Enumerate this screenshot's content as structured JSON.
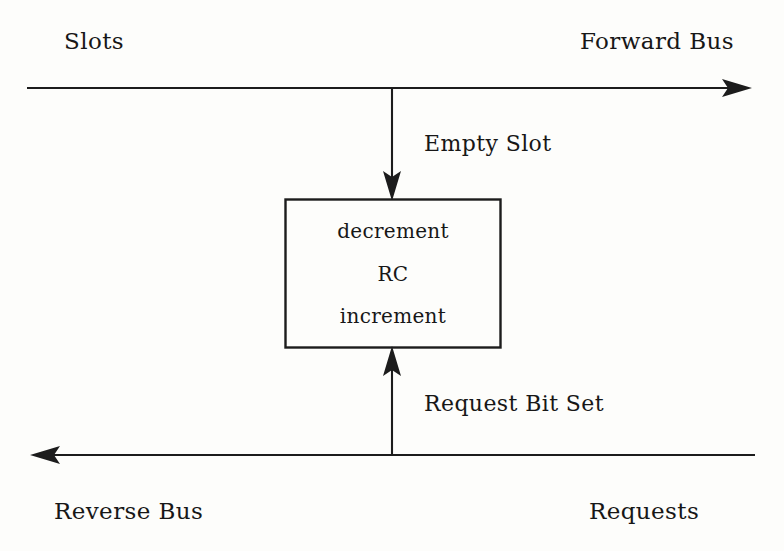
{
  "figure": {
    "kind": "block-diagram",
    "background_color": "#fdfdfb",
    "ink_color": "#1c1c1c"
  },
  "labels": {
    "slots": "Slots",
    "forward_bus": "Forward Bus",
    "empty_slot": "Empty Slot",
    "request_bit_set": "Request Bit Set",
    "reverse_bus": "Reverse Bus",
    "requests": "Requests"
  },
  "node": {
    "name": "RC",
    "lines": [
      "decrement",
      "RC",
      "increment"
    ]
  },
  "connections": [
    {
      "id": "forward-bus",
      "from": "Slots",
      "to": "Forward Bus",
      "direction": "right",
      "arrow": "end"
    },
    {
      "id": "empty-slot-tap",
      "from": "Forward Bus",
      "to": "RC",
      "direction": "down",
      "arrow": "end",
      "label": "Empty Slot"
    },
    {
      "id": "request-bit-tap",
      "from": "Reverse Bus",
      "to": "RC",
      "direction": "up",
      "arrow": "end",
      "label": "Request Bit Set"
    },
    {
      "id": "reverse-bus",
      "from": "Requests",
      "to": "Reverse Bus",
      "direction": "left",
      "arrow": "end"
    }
  ]
}
